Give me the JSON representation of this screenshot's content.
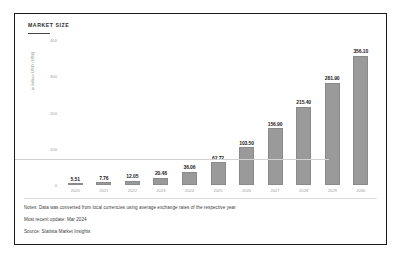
{
  "chart_data": {
    "type": "bar",
    "title": "MARKET SIZE",
    "xlabel": "",
    "ylabel": "in billion USD (US$)",
    "categories": [
      "2020",
      "2021",
      "2022",
      "2023",
      "2024",
      "2025",
      "2026",
      "2027",
      "2028",
      "2029",
      "2030"
    ],
    "values": [
      5.51,
      7.76,
      12.05,
      20.48,
      36.06,
      62.72,
      103.5,
      156.9,
      215.4,
      281.9,
      356.1
    ],
    "value_labels": [
      "5.51",
      "7.76",
      "12.05",
      "20.48",
      "36.06",
      "62.72",
      "103.50",
      "156.90",
      "215.40",
      "281.90",
      "356.10"
    ],
    "ylim": [
      0,
      400
    ],
    "yticks": [
      0,
      100,
      200,
      300,
      400
    ],
    "ytick_labels": [
      "0",
      "100",
      "200",
      "300",
      "400"
    ],
    "grid": false,
    "legend": "none",
    "bar_color": "#9a9a9a",
    "background_color": "#ffffff"
  },
  "notes": {
    "line1": "Notes: Data was converted from local currencies using average exchange rates of the respective year",
    "line2": "Most recent update: Mar 2024",
    "line3": "Source: Statista Market Insights"
  }
}
